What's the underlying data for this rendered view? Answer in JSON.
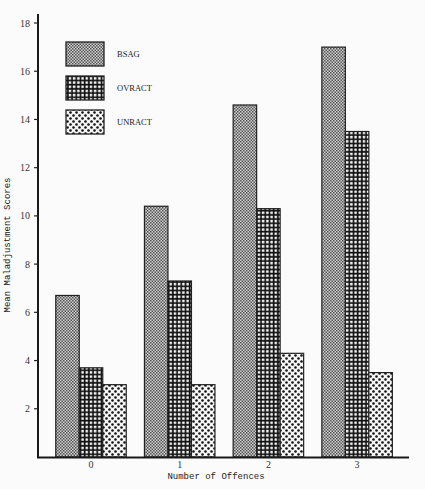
{
  "chart_data": {
    "type": "bar",
    "title": "",
    "xlabel": "Number of Offences",
    "ylabel": "Mean Maladjustment Scores",
    "categories": [
      "0",
      "1",
      "2",
      "3"
    ],
    "series": [
      {
        "name": "BSAG",
        "pattern": "fine-checker",
        "values": [
          6.7,
          10.4,
          14.6,
          17.0
        ]
      },
      {
        "name": "OVRACT",
        "pattern": "grid",
        "values": [
          3.7,
          7.3,
          10.3,
          13.5
        ]
      },
      {
        "name": "UNRACT",
        "pattern": "dots",
        "values": [
          3.0,
          3.0,
          4.3,
          3.5
        ]
      }
    ],
    "ylim": [
      0,
      18
    ],
    "yticks": [
      2,
      4,
      6,
      8,
      10,
      12,
      14,
      16,
      18
    ],
    "grid": false,
    "legend": {
      "placement": "top-left",
      "entries": [
        "BSAG",
        "OVRACT",
        "UNRACT"
      ]
    }
  }
}
